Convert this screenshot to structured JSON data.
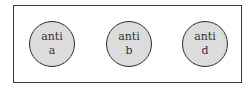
{
  "diagram": {
    "title": "",
    "circles": [
      {
        "line1": "anti",
        "line2": "a"
      },
      {
        "line1": "anti",
        "line2": "b"
      },
      {
        "line1": "anti",
        "line2": "d"
      }
    ],
    "colors": {
      "circle_fill": "#dcdcdc",
      "circle_stroke": "#2e2e2e",
      "frame_stroke": "#3a3a3a"
    }
  }
}
